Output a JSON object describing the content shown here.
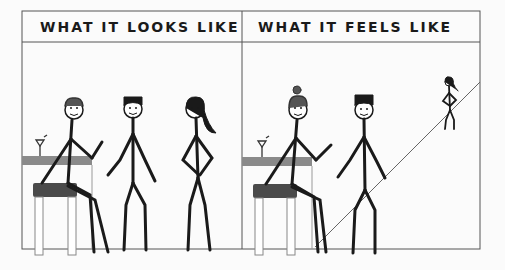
{
  "comic": {
    "panels": [
      {
        "caption": "WHAT IT LOOKS LIKE"
      },
      {
        "caption": "WHAT IT FEELS LIKE"
      }
    ]
  },
  "colors": {
    "ink": "#1a1a1a",
    "frame": "#555555",
    "bar_top": "#8a8a8a",
    "stool_seat": "#4a4a4a",
    "background": "#fbfbfb"
  }
}
